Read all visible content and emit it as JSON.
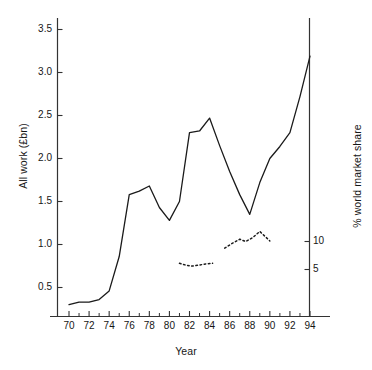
{
  "chart_data": {
    "type": "line",
    "title": "",
    "xlabel": "Year",
    "ylabel": "All work (£bn)",
    "y2label": "% world market share",
    "xlim": [
      68.5,
      95.5
    ],
    "ylim": [
      0.12,
      3.72
    ],
    "y2lim": [
      0.0,
      25.0
    ],
    "grid": false,
    "legend": null,
    "xticks": [
      70,
      72,
      74,
      76,
      78,
      80,
      82,
      84,
      86,
      88,
      90,
      92,
      94
    ],
    "xtick_labels": [
      "70",
      "72",
      "74",
      "76",
      "78",
      "80",
      "82",
      "84",
      "86",
      "88",
      "90",
      "92",
      "94"
    ],
    "xminor_ticks": [
      71,
      73,
      75,
      77,
      79,
      81,
      83,
      85,
      87,
      89,
      91,
      93
    ],
    "yticks": [
      0.5,
      1.0,
      1.5,
      2.0,
      2.5,
      3.0,
      3.5
    ],
    "ytick_labels": [
      "0.5",
      "1.0",
      "1.5",
      "2.0",
      "2.5",
      "3.0",
      "3.5"
    ],
    "y2ticks": [
      5,
      10
    ],
    "y2tick_labels": [
      "5",
      "10"
    ],
    "series": [
      {
        "name": "All work",
        "axis": "left",
        "style": "solid",
        "color": "#1a1a1a",
        "x": [
          70,
          71,
          72,
          73,
          74,
          75,
          76,
          77,
          78,
          79,
          80,
          81,
          82,
          83,
          84,
          85,
          86,
          87,
          88,
          89,
          90,
          91,
          92,
          93,
          94
        ],
        "values": [
          0.3,
          0.33,
          0.33,
          0.36,
          0.46,
          0.86,
          1.58,
          1.62,
          1.68,
          1.43,
          1.28,
          1.5,
          2.3,
          2.32,
          2.47,
          2.15,
          1.85,
          1.58,
          1.35,
          1.72,
          2.0,
          2.14,
          2.3,
          2.72,
          3.19
        ]
      },
      {
        "name": "% world market share (segment 1)",
        "axis": "right",
        "style": "dotted",
        "color": "#1a1a1a",
        "x": [
          81.0,
          81.6,
          82.2,
          83.0,
          83.6,
          84.3
        ],
        "values": [
          6.1,
          5.8,
          5.6,
          5.8,
          6.0,
          6.1
        ]
      },
      {
        "name": "% world market share (segment 2)",
        "axis": "right",
        "style": "dotted",
        "color": "#1a1a1a",
        "x": [
          85.5,
          86.2,
          87.0,
          87.6,
          88.3,
          89.0,
          90.0
        ],
        "values": [
          8.8,
          9.6,
          10.4,
          10.0,
          10.7,
          11.8,
          10.1
        ]
      }
    ]
  },
  "axes": {
    "left_title": "All work (£bn)",
    "right_title": "% world market share",
    "x_title": "Year"
  }
}
